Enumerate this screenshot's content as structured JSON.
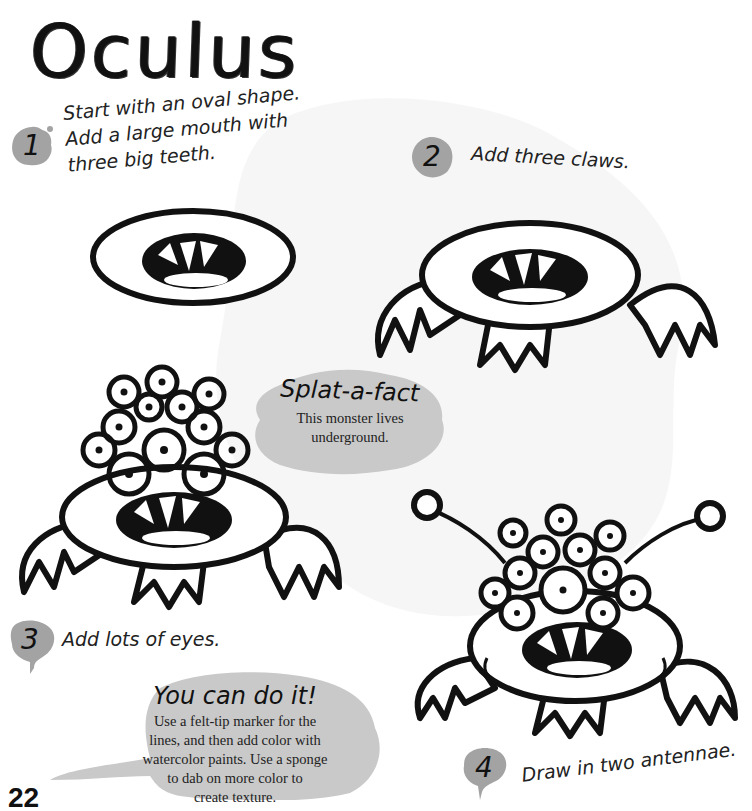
{
  "page": {
    "title": "Oculus",
    "page_number": "22"
  },
  "steps": [
    {
      "number": "1",
      "text_lines": [
        "Start with an oval shape.",
        "Add a large mouth with",
        "three big teeth."
      ]
    },
    {
      "number": "2",
      "text_lines": [
        "Add three claws."
      ]
    },
    {
      "number": "3",
      "text_lines": [
        "Add lots of eyes."
      ]
    },
    {
      "number": "4",
      "text_lines": [
        "Draw in two antennae."
      ]
    }
  ],
  "splat_a_fact": {
    "heading": "Splat-a-fact",
    "body_lines": [
      "This monster lives",
      "underground."
    ]
  },
  "you_can_do_it": {
    "heading": "You can do it!",
    "body_lines": [
      "Use a felt-tip marker for the",
      "lines, and then add color with",
      "watercolor paints. Use a sponge",
      "to dab on more color to",
      "create texture."
    ]
  },
  "colors": {
    "splash_gray": "#bdbdbd",
    "badge_gray": "#a3a3a3",
    "ink": "#111111",
    "background": "#ffffff"
  }
}
